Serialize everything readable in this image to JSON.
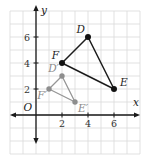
{
  "figure": {
    "title": "",
    "description_label": "coordinate plane with triangle DFE and dilation D′F′E′"
  },
  "chart_data": {
    "type": "scatter",
    "title": "",
    "xlabel": "x",
    "ylabel": "y",
    "origin_label": "O",
    "xlim": [
      -2,
      8
    ],
    "ylim": [
      -3,
      8
    ],
    "grid": true,
    "x_ticks": [
      2,
      4,
      6
    ],
    "x_tick_labels": [
      "2",
      "4",
      "6"
    ],
    "y_ticks": [
      2,
      4,
      6
    ],
    "y_tick_labels": [
      "2",
      "4",
      "6"
    ],
    "series": [
      {
        "name": "triangle-DFE",
        "kind": "polygon",
        "stroke": "#1c1c1c",
        "point_color": "#111111",
        "label_color": "#1c1c1c",
        "stroke_width": 1.5,
        "point_radius": 3,
        "vertices": [
          {
            "label": "D",
            "x": 4,
            "y": 6,
            "label_pos": "top-left"
          },
          {
            "label": "F",
            "x": 2,
            "y": 4,
            "label_pos": "top-left"
          },
          {
            "label": "E",
            "x": 6,
            "y": 2,
            "label_pos": "top-right"
          }
        ]
      },
      {
        "name": "triangle-D'F'E'",
        "kind": "polygon",
        "stroke": "#969696",
        "point_color": "#8e8e8e",
        "label_color": "#8a8a8a",
        "stroke_width": 1.3,
        "point_radius": 2.7,
        "vertices": [
          {
            "label": "D′",
            "x": 2,
            "y": 3,
            "label_pos": "top-left"
          },
          {
            "label": "F′",
            "x": 1,
            "y": 2,
            "label_pos": "bottom-left"
          },
          {
            "label": "E′",
            "x": 3,
            "y": 1,
            "label_pos": "bottom-right"
          }
        ]
      }
    ],
    "colors": {
      "background": "#ffffff",
      "grid": "#d9d9d9",
      "axis": "#1a1a1a",
      "tick_text": "#333333"
    }
  }
}
